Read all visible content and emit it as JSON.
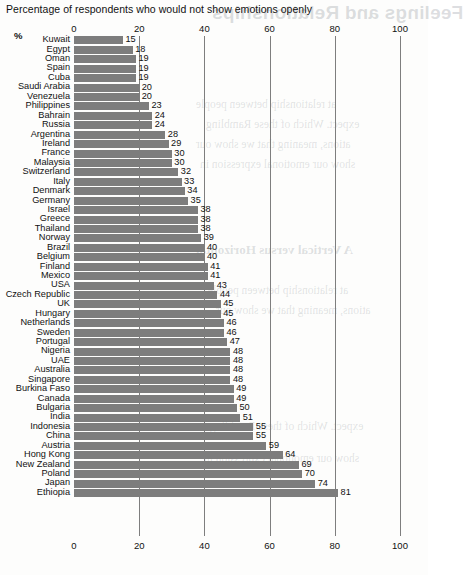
{
  "caption": "Percentage of respondents who would not show emotions openly",
  "axis_unit_label": "%",
  "bleed_through": {
    "title": "Feelings and Relationships",
    "heading": "A Vertical versus Horizontal",
    "lines": [
      "at relationship between people",
      "expect. Which of these Rambling",
      "ations, meaning that we show our",
      "show our emotional expression in"
    ]
  },
  "chart_data": {
    "type": "bar",
    "orientation": "horizontal",
    "title": "Percentage of respondents who would not show emotions openly",
    "xlabel": "%",
    "ylabel": "",
    "xlim": [
      0,
      100
    ],
    "xticks": [
      0,
      20,
      40,
      60,
      80,
      100
    ],
    "grid": true,
    "legend": "none",
    "bar_color": "#7d7d7d",
    "value_labels": true,
    "categories": [
      "Kuwait",
      "Egypt",
      "Oman",
      "Spain",
      "Cuba",
      "Saudi Arabia",
      "Venezuela",
      "Philippines",
      "Bahrain",
      "Russia",
      "Argentina",
      "Ireland",
      "France",
      "Malaysia",
      "Switzerland",
      "Italy",
      "Denmark",
      "Germany",
      "Israel",
      "Greece",
      "Thailand",
      "Norway",
      "Brazil",
      "Belgium",
      "Finland",
      "Mexico",
      "USA",
      "Czech Republic",
      "UK",
      "Hungary",
      "Netherlands",
      "Sweden",
      "Portugal",
      "Nigeria",
      "UAE",
      "Australia",
      "Singapore",
      "Burkina Faso",
      "Canada",
      "Bulgaria",
      "India",
      "Indonesia",
      "China",
      "Austria",
      "Hong Kong",
      "New Zealand",
      "Poland",
      "Japan",
      "Ethiopia"
    ],
    "values": [
      15,
      18,
      19,
      19,
      19,
      20,
      20,
      23,
      24,
      24,
      28,
      29,
      30,
      30,
      32,
      33,
      34,
      35,
      38,
      38,
      38,
      39,
      40,
      40,
      41,
      41,
      43,
      44,
      45,
      45,
      46,
      46,
      47,
      48,
      48,
      48,
      48,
      49,
      49,
      50,
      51,
      55,
      55,
      59,
      64,
      69,
      70,
      74,
      81
    ]
  }
}
